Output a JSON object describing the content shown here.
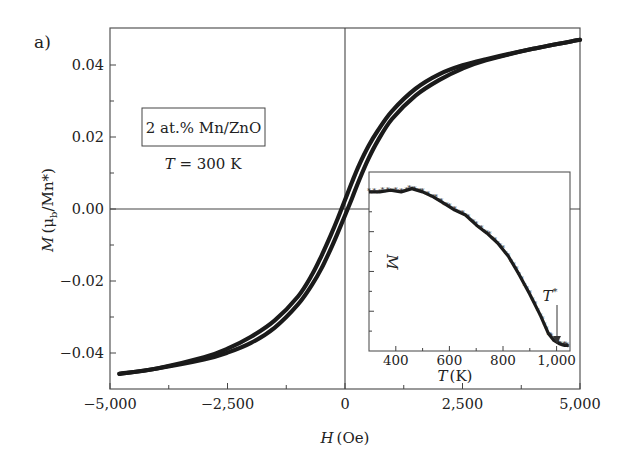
{
  "chart_data": [
    {
      "id": "main",
      "type": "line",
      "panel_label": "a)",
      "title": "",
      "xlabel": "H (Oe)",
      "xlabel_italic": "H",
      "xlabel_unit": "(Oe)",
      "ylabel": "M (μb/Mn*)",
      "ylabel_italic": "M",
      "ylabel_unit": "(μ",
      "ylabel_sub": "b",
      "ylabel_rest": "/Mn*)",
      "xlim": [
        -5000,
        5000
      ],
      "ylim": [
        -0.05,
        0.05
      ],
      "xticks": [
        -5000,
        -2500,
        0,
        2500,
        5000
      ],
      "xtick_labels": [
        "−5,000",
        "−2,500",
        "0",
        "2,500",
        "5,000"
      ],
      "xminor_ticks": [
        -3750,
        -1250,
        1250,
        3750
      ],
      "yticks": [
        0.04,
        0.02,
        0.0,
        -0.02,
        -0.04
      ],
      "ytick_labels": [
        "0.04",
        "0.02",
        "0.00",
        "−0.02",
        "−0.04"
      ],
      "yminor_ticks": [
        0.03,
        0.01,
        -0.01,
        -0.03
      ],
      "grid": false,
      "zero_lines": true,
      "annotations": {
        "boxed": "2 at.% Mn/ZnO",
        "temp_italic": "T",
        "temp_rest": " = 300 K"
      },
      "series": [
        {
          "name": "Ascending branch",
          "x": [
            -4800,
            -4000,
            -3000,
            -2500,
            -2000,
            -1500,
            -1000,
            -700,
            -500,
            -300,
            -150,
            0,
            150,
            300,
            500,
            700,
            1000,
            1500,
            2000,
            2500,
            3000,
            4000,
            5000
          ],
          "y": [
            -0.0458,
            -0.0443,
            -0.0418,
            -0.0399,
            -0.0372,
            -0.033,
            -0.0265,
            -0.021,
            -0.0165,
            -0.011,
            -0.0065,
            -0.0018,
            0.003,
            0.008,
            0.014,
            0.019,
            0.025,
            0.0315,
            0.0358,
            0.039,
            0.0413,
            0.0445,
            0.047
          ]
        },
        {
          "name": "Descending branch",
          "x": [
            5000,
            4000,
            3000,
            2500,
            2000,
            1500,
            1000,
            700,
            500,
            300,
            150,
            0,
            -150,
            -300,
            -500,
            -700,
            -1000,
            -1500,
            -2000,
            -2500,
            -3000,
            -4000,
            -4800
          ],
          "y": [
            0.047,
            0.0445,
            0.0416,
            0.0399,
            0.0374,
            0.0334,
            0.0272,
            0.0218,
            0.0175,
            0.0122,
            0.0075,
            0.0025,
            -0.0025,
            -0.0072,
            -0.013,
            -0.0182,
            -0.0243,
            -0.031,
            -0.0355,
            -0.0388,
            -0.0412,
            -0.0443,
            -0.0458
          ]
        }
      ]
    },
    {
      "id": "inset",
      "type": "scatter",
      "title": "",
      "xlabel": "T (K)",
      "xlabel_italic": "T",
      "xlabel_unit": "(K)",
      "ylabel": "M",
      "xlim": [
        300,
        1050
      ],
      "ylim": [
        0,
        1
      ],
      "xticks": [
        400,
        600,
        800,
        1000
      ],
      "xtick_labels": [
        "400",
        "600",
        "800",
        "1,000"
      ],
      "xminor_ticks": [
        500,
        700,
        900
      ],
      "yticks_unlabeled": 8,
      "grid": false,
      "annotations": {
        "arrow_label": "T*",
        "arrow_label_italic": "T",
        "arrow_label_sup": "*",
        "arrow_x": 1000
      },
      "series": [
        {
          "name": "M(T)",
          "x": [
            300,
            340,
            380,
            420,
            460,
            500,
            540,
            580,
            620,
            660,
            700,
            740,
            780,
            820,
            860,
            900,
            940,
            970,
            990,
            1010,
            1030,
            1045
          ],
          "y": [
            0.94,
            0.94,
            0.95,
            0.94,
            0.96,
            0.94,
            0.91,
            0.87,
            0.83,
            0.8,
            0.74,
            0.69,
            0.63,
            0.55,
            0.44,
            0.32,
            0.19,
            0.08,
            0.04,
            0.02,
            0.01,
            0.01
          ]
        }
      ]
    }
  ]
}
